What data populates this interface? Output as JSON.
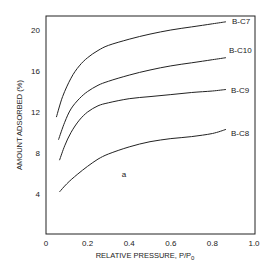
{
  "chart_data": {
    "type": "line",
    "title": "",
    "panel_label": "a",
    "xlabel": "RELATIVE PRESSURE, P/P",
    "xlabel_subscript": "0",
    "ylabel": "AMOUNT ADSORBED (%)",
    "xlim": [
      0,
      1.0
    ],
    "ylim": [
      0,
      21.5
    ],
    "x_ticks": [
      "0",
      "0.2",
      "0.4",
      "0.6",
      "0.8",
      "1.0"
    ],
    "y_ticks": [
      "4",
      "8",
      "12",
      "16",
      "20"
    ],
    "grid": false,
    "legend": "inline labels at right end of curves",
    "series": [
      {
        "name": "B-C7",
        "x": [
          0.05,
          0.08,
          0.12,
          0.16,
          0.2,
          0.25,
          0.3,
          0.4,
          0.5,
          0.6,
          0.7,
          0.8,
          0.865
        ],
        "y": [
          11.5,
          13.5,
          15.3,
          16.5,
          17.3,
          18.0,
          18.5,
          19.1,
          19.6,
          20.0,
          20.3,
          20.6,
          20.8
        ]
      },
      {
        "name": "B-C10",
        "x": [
          0.06,
          0.09,
          0.12,
          0.16,
          0.2,
          0.25,
          0.3,
          0.4,
          0.5,
          0.6,
          0.7,
          0.8,
          0.865
        ],
        "y": [
          9.3,
          11.0,
          12.3,
          13.3,
          14.0,
          14.6,
          15.0,
          15.6,
          16.1,
          16.5,
          16.8,
          17.1,
          17.3
        ]
      },
      {
        "name": "B-C9",
        "x": [
          0.065,
          0.09,
          0.12,
          0.16,
          0.2,
          0.25,
          0.3,
          0.4,
          0.5,
          0.6,
          0.7,
          0.8,
          0.865
        ],
        "y": [
          7.3,
          8.7,
          10.0,
          11.2,
          12.0,
          12.6,
          12.9,
          13.3,
          13.5,
          13.7,
          13.9,
          14.05,
          14.2
        ]
      },
      {
        "name": "B-C8",
        "x": [
          0.065,
          0.1,
          0.15,
          0.2,
          0.25,
          0.3,
          0.4,
          0.5,
          0.6,
          0.7,
          0.8,
          0.865
        ],
        "y": [
          4.2,
          5.0,
          5.9,
          6.7,
          7.4,
          7.9,
          8.6,
          9.1,
          9.4,
          9.6,
          9.9,
          10.3
        ]
      }
    ]
  }
}
